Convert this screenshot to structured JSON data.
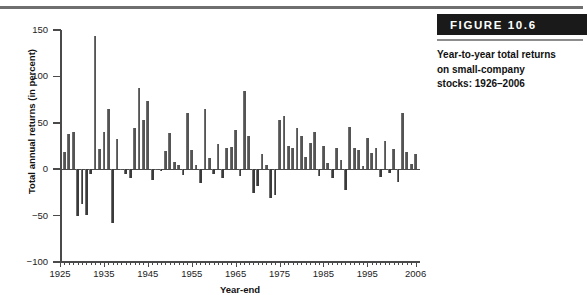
{
  "figure": {
    "badge_label": "FIGURE 10.6",
    "caption": "Year-to-year total returns on small-company stocks: 1926–2006"
  },
  "chart_data": {
    "type": "bar",
    "title": "Year-to-year total returns on small-company stocks: 1926–2006",
    "xlabel": "Year-end",
    "ylabel": "Total annual returns (in percent)",
    "ylim": [
      -100,
      150
    ],
    "xlim": [
      1925,
      2007
    ],
    "ytick_labels": [
      "150",
      "100",
      "50",
      "0",
      "−50",
      "−100"
    ],
    "ytick_values": [
      150,
      100,
      50,
      0,
      -50,
      -100
    ],
    "xtick_labels": [
      "1925",
      "1935",
      "1945",
      "1955",
      "1965",
      "1975",
      "1985",
      "1995",
      "2006"
    ],
    "xtick_values": [
      1925,
      1935,
      1945,
      1955,
      1965,
      1975,
      1985,
      1995,
      2006
    ],
    "grid": false,
    "legend": false,
    "bar_color": "#545454",
    "negative_bar_color": "#3a3a3a",
    "categories": [
      1926,
      1927,
      1928,
      1929,
      1930,
      1931,
      1932,
      1933,
      1934,
      1935,
      1936,
      1937,
      1938,
      1939,
      1940,
      1941,
      1942,
      1943,
      1944,
      1945,
      1946,
      1947,
      1948,
      1949,
      1950,
      1951,
      1952,
      1953,
      1954,
      1955,
      1956,
      1957,
      1958,
      1959,
      1960,
      1961,
      1962,
      1963,
      1964,
      1965,
      1966,
      1967,
      1968,
      1969,
      1970,
      1971,
      1972,
      1973,
      1974,
      1975,
      1976,
      1977,
      1978,
      1979,
      1980,
      1981,
      1982,
      1983,
      1984,
      1985,
      1986,
      1987,
      1988,
      1989,
      1990,
      1991,
      1992,
      1993,
      1994,
      1995,
      1996,
      1997,
      1998,
      1999,
      2000,
      2001,
      2002,
      2003,
      2004,
      2005,
      2006
    ],
    "values": [
      18,
      38,
      40,
      -50,
      -38,
      -49,
      -5,
      143,
      22,
      40,
      65,
      -58,
      33,
      0,
      -5,
      -9,
      44,
      88,
      53,
      73,
      -12,
      0,
      -2,
      20,
      39,
      8,
      4,
      -6,
      61,
      21,
      4,
      -15,
      65,
      12,
      -5,
      27,
      -10,
      23,
      24,
      42,
      -7,
      84,
      36,
      -26,
      -18,
      16,
      5,
      -31,
      -28,
      53,
      57,
      25,
      23,
      44,
      36,
      13,
      28,
      40,
      -7,
      25,
      7,
      -10,
      23,
      10,
      -22,
      45,
      23,
      21,
      3,
      34,
      17,
      23,
      -8,
      30,
      -4,
      22,
      -14,
      61,
      18,
      6,
      16
    ]
  }
}
